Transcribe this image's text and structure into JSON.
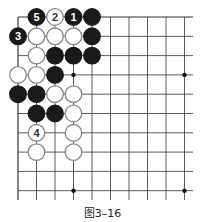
{
  "caption": "图3–16",
  "board": {
    "origin": [
      18,
      17
    ],
    "spacing": [
      18.5,
      19.3
    ],
    "cols": 10,
    "rows": 10,
    "right_extent": 193,
    "bottom_extent": 200,
    "line_color": "#333333",
    "star_points": [
      [
        3,
        3
      ],
      [
        9,
        3
      ],
      [
        3,
        9
      ],
      [
        9,
        9
      ]
    ],
    "stones": [
      {
        "c": 1,
        "r": 0,
        "color": "black",
        "label": "5"
      },
      {
        "c": 2,
        "r": 0,
        "color": "white",
        "label": "2"
      },
      {
        "c": 3,
        "r": 0,
        "color": "black",
        "label": "1"
      },
      {
        "c": 4,
        "r": 0,
        "color": "black",
        "label": ""
      },
      {
        "c": 0,
        "r": 1,
        "color": "black",
        "label": "3"
      },
      {
        "c": 1,
        "r": 1,
        "color": "white",
        "label": ""
      },
      {
        "c": 2,
        "r": 1,
        "color": "white",
        "label": ""
      },
      {
        "c": 3,
        "r": 1,
        "color": "white",
        "label": ""
      },
      {
        "c": 4,
        "r": 1,
        "color": "black",
        "label": ""
      },
      {
        "c": 1,
        "r": 2,
        "color": "white",
        "label": ""
      },
      {
        "c": 2,
        "r": 2,
        "color": "black",
        "label": ""
      },
      {
        "c": 3,
        "r": 2,
        "color": "black",
        "label": ""
      },
      {
        "c": 4,
        "r": 2,
        "color": "black",
        "label": ""
      },
      {
        "c": 0,
        "r": 3,
        "color": "white",
        "label": ""
      },
      {
        "c": 1,
        "r": 3,
        "color": "white",
        "label": ""
      },
      {
        "c": 2,
        "r": 3,
        "color": "black",
        "label": ""
      },
      {
        "c": 0,
        "r": 4,
        "color": "black",
        "label": ""
      },
      {
        "c": 1,
        "r": 4,
        "color": "black",
        "label": ""
      },
      {
        "c": 2,
        "r": 4,
        "color": "white",
        "label": ""
      },
      {
        "c": 3,
        "r": 4,
        "color": "white",
        "label": ""
      },
      {
        "c": 1,
        "r": 5,
        "color": "black",
        "label": ""
      },
      {
        "c": 2,
        "r": 5,
        "color": "black",
        "label": ""
      },
      {
        "c": 3,
        "r": 5,
        "color": "white",
        "label": ""
      },
      {
        "c": 1,
        "r": 6,
        "color": "white",
        "label": "4"
      },
      {
        "c": 3,
        "r": 6,
        "color": "white",
        "label": ""
      },
      {
        "c": 1,
        "r": 7,
        "color": "white",
        "label": ""
      },
      {
        "c": 3,
        "r": 7,
        "color": "white",
        "label": ""
      }
    ]
  }
}
